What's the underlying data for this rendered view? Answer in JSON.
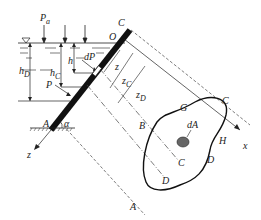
{
  "diagram": {
    "labels": {
      "pa": "P",
      "pa_sub": "a",
      "C_top": "C",
      "O": "O",
      "h": "h",
      "dP": "dP",
      "hC": "h",
      "hC_sub": "C",
      "hD": "h",
      "hD_sub": "D",
      "z": "z",
      "zC": "z",
      "zC_sub": "C",
      "zD": "z",
      "zD_sub": "D",
      "P": "P",
      "A_left": "A",
      "alpha": "α",
      "z_axis": "z",
      "G": "G",
      "C_right": "C",
      "B": "B",
      "dA": "dA",
      "H": "H",
      "x_axis": "x",
      "C_mid": "C",
      "D_mid": "D",
      "D_right": "D",
      "A_bottom": "A"
    },
    "colors": {
      "line": "#222222",
      "plate": "#111111",
      "hatch": "#666666"
    }
  }
}
